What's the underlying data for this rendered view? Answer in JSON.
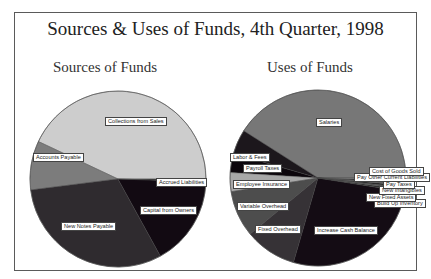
{
  "title": "Sources & Uses of Funds, 4th Quarter, 1998",
  "chart_data": [
    {
      "type": "pie",
      "title": "Sources of Funds",
      "center": [
        118,
        179
      ],
      "radius": 88,
      "start_angle_deg": 0,
      "direction": "counterclockwise",
      "slices": [
        {
          "label": "Collections from Sales",
          "value": 43,
          "color": "#cdcdcd",
          "label_pos": [
            105,
            117
          ]
        },
        {
          "label": "Accounts Payable",
          "value": 9,
          "color": "#7c7c7c",
          "label_pos": [
            33,
            153
          ]
        },
        {
          "label": "New Notes Payable",
          "value": 31,
          "color": "#2f2b2f",
          "label_pos": [
            61,
            222
          ]
        },
        {
          "label": "Capital from Owners",
          "value": 16.5,
          "color": "#120a12",
          "label_pos": [
            140,
            206
          ]
        },
        {
          "label": "Accrued Liabilities",
          "value": 0.5,
          "color": "#3a3a3a",
          "label_pos": [
            156,
            178
          ]
        }
      ]
    },
    {
      "type": "pie",
      "title": "Uses of Funds",
      "center": [
        318,
        178
      ],
      "radius": 88,
      "start_angle_deg": 0,
      "direction": "counterclockwise",
      "slices": [
        {
          "label": "Salaries",
          "value": 41,
          "color": "#777777",
          "label_pos": [
            316,
            118
          ]
        },
        {
          "label": "Labor & Fees",
          "value": 4.5,
          "color": "#1c171c",
          "label_pos": [
            230,
            153
          ]
        },
        {
          "label": "Payroll Taxes",
          "value": 3.5,
          "color": "#0c060c",
          "label_pos": [
            243,
            164
          ]
        },
        {
          "label": "Employee Insurance",
          "value": 3.5,
          "color": "#a8a8a8",
          "label_pos": [
            233,
            180
          ]
        },
        {
          "label": "Variable Overhead",
          "value": 8.5,
          "color": "#4d4d4d",
          "label_pos": [
            237,
            202
          ]
        },
        {
          "label": "Fixed Overhead",
          "value": 9.5,
          "color": "#363236",
          "label_pos": [
            255,
            225
          ]
        },
        {
          "label": "Increase Cash Balance",
          "value": 27,
          "color": "#140c14",
          "label_pos": [
            314,
            226
          ]
        },
        {
          "label": "Build Up Inventory",
          "value": 0.4,
          "color": "#2a2a2a",
          "label_pos": [
            374,
            199
          ]
        },
        {
          "label": "New Fixed Assets",
          "value": 0.4,
          "color": "#555555",
          "label_pos": [
            366,
            193
          ]
        },
        {
          "label": "New Intangibles",
          "value": 0.4,
          "color": "#222222",
          "label_pos": [
            379,
            186
          ]
        },
        {
          "label": "Pay Taxes",
          "value": 0.4,
          "color": "#666666",
          "label_pos": [
            383,
            180
          ]
        },
        {
          "label": "Pay Other Current Liabilities",
          "value": 0.5,
          "color": "#333333",
          "label_pos": [
            354,
            173
          ]
        },
        {
          "label": "Cost of Goods Sold",
          "value": 0.4,
          "color": "#888888",
          "label_pos": [
            369,
            167
          ]
        }
      ]
    }
  ]
}
